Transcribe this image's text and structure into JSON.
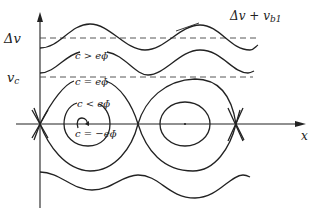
{
  "diagram": {
    "type": "phase-space trajectories",
    "axes": {
      "x_label": "x",
      "y_ticks": [
        {
          "label": "Δv",
          "y": 38
        },
        {
          "label": "v_c",
          "y": 77
        }
      ]
    },
    "labels": {
      "top_annotation": "Δv + v_b1",
      "top_annotation_main": "Δv + v",
      "top_annotation_sub": "b1",
      "delta_v": "Δv",
      "v_c_main": "v",
      "v_c_sub": "c",
      "c_gt": "c > eϕ̄",
      "c_eq": "c = eϕ̄",
      "c_lt": "c < eϕ̄",
      "c_neg": "c = −eϕ̄",
      "x_axis": "x"
    },
    "regions": [
      "untrapped (c > eϕ̄)",
      "separatrix (c = eϕ̄)",
      "trapped (c < eϕ̄)",
      "O-point (c = −eϕ̄)"
    ]
  }
}
